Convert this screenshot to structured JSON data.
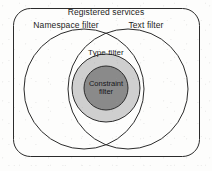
{
  "diagram": {
    "type": "venn",
    "title": "Registered services",
    "background_color": "#fdfdfc",
    "stroke_color": "#2b2b2b",
    "regions": [
      {
        "name": "registered-services",
        "label": "Registered services",
        "shape": "rounded-rectangle",
        "fill": "none",
        "outermost": true
      },
      {
        "name": "namespace-filter",
        "label": "Namespace filter",
        "shape": "circle",
        "fill": "none"
      },
      {
        "name": "text-filter",
        "label": "Text filter",
        "shape": "circle",
        "fill": "none"
      },
      {
        "name": "type-filter",
        "label": "Type filter",
        "shape": "circle",
        "fill": "#cfcfcf"
      },
      {
        "name": "constraint-filter",
        "label_line1": "Constraint",
        "label_line2": "filter",
        "shape": "circle",
        "fill": "#8a8a8a",
        "innermost": true
      }
    ]
  },
  "labels": {
    "registered_services": "Registered services",
    "namespace_filter": "Namespace filter",
    "text_filter": "Text filter",
    "type_filter": "Type filter",
    "constraint_filter_line1": "Constraint",
    "constraint_filter_line2": "filter"
  },
  "colors": {
    "page_background": "#fdfdfc",
    "outline": "#2b2b2b",
    "type_filter_fill": "#cfcfcf",
    "constraint_filter_fill": "#8a8a8a",
    "text": "#1d1d1d"
  }
}
